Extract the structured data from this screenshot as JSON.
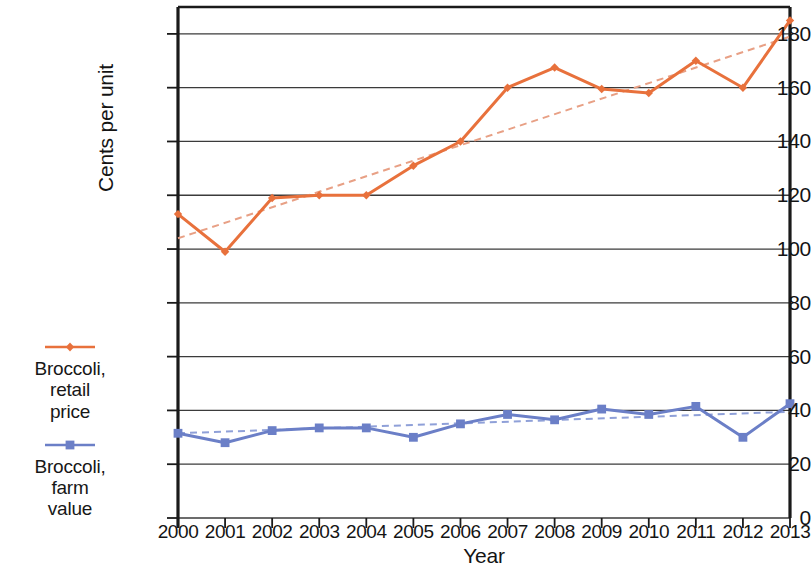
{
  "chart_data": {
    "type": "line",
    "title": "",
    "xlabel": "Year",
    "ylabel": "Cents per unit",
    "x": [
      2000,
      2001,
      2002,
      2003,
      2004,
      2005,
      2006,
      2007,
      2008,
      2009,
      2010,
      2011,
      2012,
      2013
    ],
    "categories": [
      "2000",
      "2001",
      "2002",
      "2003",
      "2004",
      "2005",
      "2006",
      "2007",
      "2008",
      "2009",
      "2010",
      "2011",
      "2012",
      "2013"
    ],
    "xlim": [
      2000,
      2013
    ],
    "ylim": [
      0,
      190
    ],
    "yticks": [
      0,
      20,
      40,
      60,
      80,
      100,
      120,
      140,
      160,
      180
    ],
    "ytick_labels": [
      "0",
      "20",
      "40",
      "60",
      "80",
      "100",
      "120",
      "140",
      "160",
      "180"
    ],
    "grid": "horizontal",
    "legend_position": "left",
    "series": [
      {
        "name": "Broccoli, retail price",
        "legend_label_lines": [
          "Broccoli,",
          "retail",
          "price"
        ],
        "color": "#e8713c",
        "marker": "diamond",
        "linestyle": "solid",
        "values": [
          113,
          99,
          119,
          120,
          120,
          131,
          140,
          160,
          167.5,
          159.5,
          158,
          170,
          160,
          185
        ],
        "trendline": {
          "linestyle": "dashed",
          "color": "#e8a085",
          "start_value": 104,
          "end_value": 179
        }
      },
      {
        "name": "Broccoli, farm value",
        "legend_label_lines": [
          "Broccoli,",
          "farm",
          "value"
        ],
        "color": "#6b7fc7",
        "marker": "square",
        "linestyle": "solid",
        "values": [
          31.5,
          28,
          32.5,
          33.5,
          33.5,
          30,
          35,
          38.5,
          36.5,
          40.5,
          38.5,
          41.5,
          30,
          42.5
        ],
        "trendline": {
          "linestyle": "dashed",
          "color": "#8fa0d8",
          "start_value": 31.5,
          "end_value": 39.5
        }
      }
    ]
  },
  "axis": {
    "y_title": "Cents per unit",
    "x_title": "Year"
  },
  "colors": {
    "retail": "#e8713c",
    "farm": "#6b7fc7",
    "retail_trend": "#e8a085",
    "farm_trend": "#8fa0d8",
    "gridline": "#3b3b3b",
    "frame": "#1a1a1a"
  }
}
